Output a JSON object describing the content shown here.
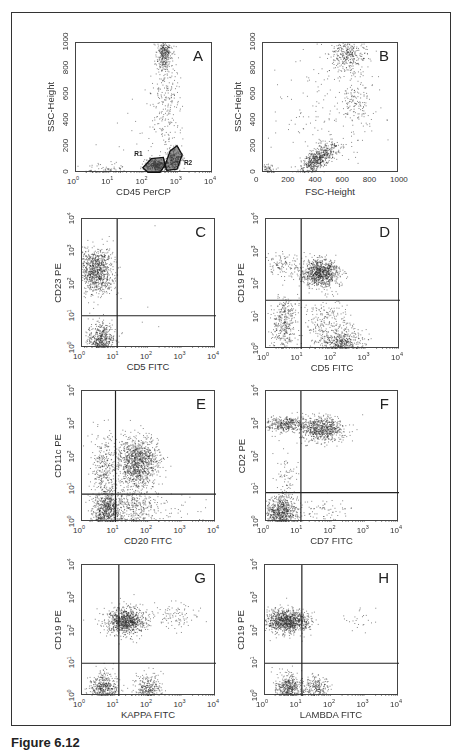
{
  "figure": {
    "caption": "Figure 6.12"
  },
  "chart_data": [
    {
      "id": "A",
      "type": "scatter",
      "letter": "A",
      "xlabel": "CD45 PerCP",
      "ylabel": "SSC-Height",
      "xscale": "log",
      "xticks": [
        "10^0",
        "10^1",
        "10^2",
        "10^3",
        "10^4"
      ],
      "xlim": [
        0,
        4
      ],
      "yscale": "linear",
      "yticks": [
        "0",
        "200",
        "400",
        "600",
        "800",
        "1000"
      ],
      "ylim": [
        0,
        1000
      ],
      "gates": [
        {
          "name": "R1",
          "polygon": [
            [
              1.95,
              40
            ],
            [
              2.2,
              110
            ],
            [
              2.55,
              120
            ],
            [
              2.6,
              60
            ],
            [
              2.45,
              5
            ],
            [
              2.1,
              5
            ]
          ]
        },
        {
          "name": "R2",
          "polygon": [
            [
              2.6,
              60
            ],
            [
              2.75,
              170
            ],
            [
              2.95,
              210
            ],
            [
              3.1,
              140
            ],
            [
              2.95,
              30
            ],
            [
              2.65,
              20
            ]
          ]
        }
      ],
      "clusters": [
        {
          "cx": 2.35,
          "cy": 60,
          "sx": 0.18,
          "sy": 25,
          "n": 350
        },
        {
          "cx": 2.85,
          "cy": 110,
          "sx": 0.12,
          "sy": 40,
          "n": 250
        },
        {
          "cx": 2.55,
          "cy": 920,
          "sx": 0.1,
          "sy": 70,
          "n": 300
        },
        {
          "cx": 2.65,
          "cy": 550,
          "sx": 0.22,
          "sy": 220,
          "n": 260
        },
        {
          "cx": 0.8,
          "cy": 30,
          "sx": 0.35,
          "sy": 20,
          "n": 70
        },
        {
          "cx": 1.8,
          "cy": 250,
          "sx": 0.6,
          "sy": 180,
          "n": 40
        }
      ]
    },
    {
      "id": "B",
      "type": "scatter",
      "letter": "B",
      "xlabel": "FSC-Height",
      "ylabel": "SSC-Height",
      "xscale": "linear",
      "xticks": [
        "0",
        "200",
        "400",
        "600",
        "800",
        "1000"
      ],
      "xlim": [
        0,
        1000
      ],
      "yscale": "linear",
      "yticks": [
        "0",
        "200",
        "400",
        "600",
        "800",
        "1000"
      ],
      "ylim": [
        0,
        1000
      ],
      "clusters": [
        {
          "cx": 400,
          "cy": 110,
          "sx": 70,
          "sy": 40,
          "n": 600,
          "tilt": 0.9
        },
        {
          "cx": 620,
          "cy": 920,
          "sx": 70,
          "sy": 70,
          "n": 350
        },
        {
          "cx": 680,
          "cy": 550,
          "sx": 60,
          "sy": 120,
          "n": 150
        },
        {
          "cx": 450,
          "cy": 450,
          "sx": 250,
          "sy": 280,
          "n": 160
        },
        {
          "cx": 40,
          "cy": 30,
          "sx": 20,
          "sy": 20,
          "n": 50
        }
      ]
    },
    {
      "id": "C",
      "type": "scatter",
      "letter": "C",
      "xlabel": "CD5 FITC",
      "ylabel": "CD23 PE",
      "xscale": "log",
      "xticks": [
        "10^0",
        "10^1",
        "10^2",
        "10^3",
        "10^4"
      ],
      "xlim": [
        0,
        4
      ],
      "yscale": "log",
      "yticks": [
        "10^0",
        "10^1",
        "10^2",
        "10^3",
        "10^4"
      ],
      "ylim": [
        0,
        4
      ],
      "quadrant": {
        "x": 1.05,
        "y": 1.0
      },
      "clusters": [
        {
          "cx": 0.4,
          "cy": 2.4,
          "sx": 0.25,
          "sy": 0.35,
          "n": 900
        },
        {
          "cx": 0.55,
          "cy": 0.25,
          "sx": 0.2,
          "sy": 0.25,
          "n": 500
        },
        {
          "cx": 1.5,
          "cy": 1.5,
          "sx": 0.6,
          "sy": 0.8,
          "n": 8
        }
      ]
    },
    {
      "id": "D",
      "type": "scatter",
      "letter": "D",
      "xlabel": "CD5 FITC",
      "ylabel": "CD19 PE",
      "xscale": "log",
      "xticks": [
        "10^0",
        "10^1",
        "10^2",
        "10^3",
        "10^4"
      ],
      "xlim": [
        0,
        4
      ],
      "yscale": "log",
      "yticks": [
        "10^0",
        "10^1",
        "10^2",
        "10^3",
        "10^4"
      ],
      "ylim": [
        0,
        4
      ],
      "quadrant": {
        "x": 1.05,
        "y": 1.5
      },
      "clusters": [
        {
          "cx": 1.6,
          "cy": 2.35,
          "sx": 0.28,
          "sy": 0.22,
          "n": 900
        },
        {
          "cx": 0.55,
          "cy": 0.8,
          "sx": 0.2,
          "sy": 0.4,
          "n": 350
        },
        {
          "cx": 2.3,
          "cy": 0.2,
          "sx": 0.3,
          "sy": 0.2,
          "n": 450
        },
        {
          "cx": 1.8,
          "cy": 0.8,
          "sx": 0.35,
          "sy": 0.4,
          "n": 250
        },
        {
          "cx": 0.5,
          "cy": 2.6,
          "sx": 0.3,
          "sy": 0.2,
          "n": 120
        }
      ]
    },
    {
      "id": "E",
      "type": "scatter",
      "letter": "E",
      "xlabel": "CD20 FITC",
      "ylabel": "CD11c PE",
      "xscale": "log",
      "xticks": [
        "10^0",
        "10^1",
        "10^2",
        "10^3",
        "10^4"
      ],
      "xlim": [
        0,
        4
      ],
      "yscale": "log",
      "yticks": [
        "10^0",
        "10^1",
        "10^2",
        "10^3",
        "10^4"
      ],
      "ylim": [
        0,
        4
      ],
      "quadrant": {
        "x": 1.0,
        "y": 0.85
      },
      "clusters": [
        {
          "cx": 1.65,
          "cy": 1.85,
          "sx": 0.3,
          "sy": 0.38,
          "n": 1100
        },
        {
          "cx": 0.75,
          "cy": 0.3,
          "sx": 0.22,
          "sy": 0.3,
          "n": 700
        },
        {
          "cx": 0.65,
          "cy": 1.6,
          "sx": 0.2,
          "sy": 0.55,
          "n": 350
        },
        {
          "cx": 1.6,
          "cy": 0.4,
          "sx": 0.35,
          "sy": 0.35,
          "n": 350
        },
        {
          "cx": 2.7,
          "cy": 0.3,
          "sx": 0.4,
          "sy": 0.3,
          "n": 40
        }
      ]
    },
    {
      "id": "F",
      "type": "scatter",
      "letter": "F",
      "xlabel": "CD7 FITC",
      "ylabel": "CD2 PE",
      "xscale": "log",
      "xticks": [
        "10^0",
        "10^1",
        "10^2",
        "10^3",
        "10^4"
      ],
      "xlim": [
        0,
        4
      ],
      "yscale": "log",
      "yticks": [
        "10^0",
        "10^1",
        "10^2",
        "10^3",
        "10^4"
      ],
      "ylim": [
        0,
        4
      ],
      "quadrant": {
        "x": 1.05,
        "y": 0.9
      },
      "clusters": [
        {
          "cx": 1.65,
          "cy": 2.85,
          "sx": 0.35,
          "sy": 0.18,
          "n": 700
        },
        {
          "cx": 0.55,
          "cy": 3.0,
          "sx": 0.3,
          "sy": 0.12,
          "n": 350
        },
        {
          "cx": 0.45,
          "cy": 0.3,
          "sx": 0.25,
          "sy": 0.25,
          "n": 700
        },
        {
          "cx": 0.6,
          "cy": 1.3,
          "sx": 0.2,
          "sy": 0.5,
          "n": 80
        },
        {
          "cx": 1.7,
          "cy": 0.3,
          "sx": 0.4,
          "sy": 0.25,
          "n": 80
        }
      ]
    },
    {
      "id": "G",
      "type": "scatter",
      "letter": "G",
      "xlabel": "KAPPA FITC",
      "ylabel": "CD19 PE",
      "xscale": "log",
      "xticks": [
        "10^0",
        "10^1",
        "10^2",
        "10^3",
        "10^4"
      ],
      "xlim": [
        0,
        4
      ],
      "yscale": "log",
      "yticks": [
        "10^0",
        "10^1",
        "10^2",
        "10^3",
        "10^4"
      ],
      "ylim": [
        0,
        4
      ],
      "quadrant": {
        "x": 1.1,
        "y": 1.0
      },
      "clusters": [
        {
          "cx": 1.3,
          "cy": 2.3,
          "sx": 0.28,
          "sy": 0.2,
          "n": 900
        },
        {
          "cx": 0.65,
          "cy": 0.25,
          "sx": 0.2,
          "sy": 0.22,
          "n": 450
        },
        {
          "cx": 1.95,
          "cy": 0.25,
          "sx": 0.22,
          "sy": 0.22,
          "n": 300
        },
        {
          "cx": 2.7,
          "cy": 2.5,
          "sx": 0.4,
          "sy": 0.2,
          "n": 100
        }
      ]
    },
    {
      "id": "H",
      "type": "scatter",
      "letter": "H",
      "xlabel": "LAMBDA FITC",
      "ylabel": "CD19 PE",
      "xscale": "log",
      "xticks": [
        "10^0",
        "10^1",
        "10^2",
        "10^3",
        "10^4"
      ],
      "xlim": [
        0,
        4
      ],
      "yscale": "log",
      "yticks": [
        "10^0",
        "10^1",
        "10^2",
        "10^3",
        "10^4"
      ],
      "ylim": [
        0,
        4
      ],
      "quadrant": {
        "x": 1.1,
        "y": 1.0
      },
      "clusters": [
        {
          "cx": 0.65,
          "cy": 2.3,
          "sx": 0.32,
          "sy": 0.18,
          "n": 1000
        },
        {
          "cx": 0.7,
          "cy": 0.25,
          "sx": 0.2,
          "sy": 0.22,
          "n": 450
        },
        {
          "cx": 1.5,
          "cy": 0.25,
          "sx": 0.2,
          "sy": 0.2,
          "n": 250
        },
        {
          "cx": 2.8,
          "cy": 2.4,
          "sx": 0.2,
          "sy": 0.2,
          "n": 25
        }
      ]
    }
  ],
  "layout": [
    {
      "id": "A",
      "left": 75,
      "top": 42,
      "width": 137,
      "height": 130
    },
    {
      "id": "B",
      "left": 262,
      "top": 42,
      "width": 136,
      "height": 130
    },
    {
      "id": "C",
      "left": 81,
      "top": 218,
      "width": 134,
      "height": 129
    },
    {
      "id": "D",
      "left": 265,
      "top": 218,
      "width": 134,
      "height": 130
    },
    {
      "id": "E",
      "left": 81,
      "top": 390,
      "width": 134,
      "height": 131
    },
    {
      "id": "F",
      "left": 265,
      "top": 390,
      "width": 133,
      "height": 131
    },
    {
      "id": "G",
      "left": 81,
      "top": 564,
      "width": 134,
      "height": 131
    },
    {
      "id": "H",
      "left": 264,
      "top": 564,
      "width": 134,
      "height": 131
    }
  ],
  "colors": {
    "dots": "#2a2a2a",
    "frame": "#333333",
    "quadrant_line": "#222222"
  }
}
